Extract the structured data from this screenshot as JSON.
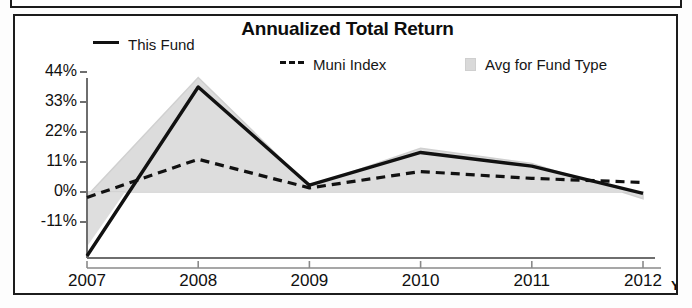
{
  "chart_data": {
    "type": "line",
    "title": "Annualized Total Return",
    "xlabel": "",
    "ylabel": "",
    "categories": [
      "2007",
      "2008",
      "2009",
      "2010",
      "2011",
      "2012"
    ],
    "x_axis_note": "YTD",
    "ytick_labels": [
      "44%",
      "33%",
      "22%",
      "11%",
      "0%",
      "-11%"
    ],
    "ytick_values": [
      44,
      33,
      22,
      11,
      0,
      -11
    ],
    "ylim": [
      -22,
      48
    ],
    "grid": false,
    "legend_position": "top",
    "series": [
      {
        "name": "This Fund",
        "style": "solid",
        "color": "#111111",
        "values": [
          -20,
          38.5,
          2.5,
          14.5,
          9.5,
          -0.5
        ]
      },
      {
        "name": "Muni Index",
        "style": "dashed",
        "color": "#111111",
        "values": [
          -2,
          12,
          1.5,
          7.5,
          5,
          3.5
        ]
      },
      {
        "name": "Avg for Fund Type",
        "style": "shaded-band",
        "color": "#dcdcdc",
        "values": [
          -1.5,
          42,
          2,
          16,
          10.5,
          -2.5
        ]
      }
    ],
    "legend": [
      {
        "label": "This Fund",
        "swatch": "solid-line-swatch"
      },
      {
        "label": "Muni Index",
        "swatch": "dashed-line-swatch"
      },
      {
        "label": "Avg for Fund Type",
        "swatch": "shaded-block-swatch"
      }
    ]
  },
  "colors": {
    "line": "#111111",
    "band": "#dcdcdc",
    "axis": "#6e6e6e",
    "frame": "#1c1c1c",
    "text": "#101010"
  }
}
